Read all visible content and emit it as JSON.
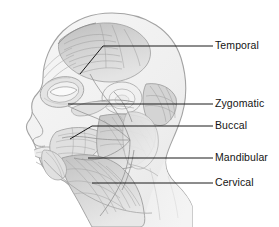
{
  "figure": {
    "background_color": "#ffffff",
    "outline_color": "#9a9a9a",
    "muscle_fill_light": "#e2e2e2",
    "muscle_fill_mid": "#c6c6c6",
    "muscle_fill_dark": "#a8a8a8",
    "skin_fill": "#f2f2f2",
    "leader_color": "#1a1a1a",
    "label_color": "#141414"
  },
  "labels": [
    {
      "id": "temporal",
      "text": "Temporal",
      "text_x": 215,
      "text_y": 40,
      "leader": "M 213 46 L 103 46 L 80 74",
      "anchor_x": 80,
      "anchor_y": 74
    },
    {
      "id": "zygomatic",
      "text": "Zygomatic",
      "text_x": 215,
      "text_y": 98,
      "leader": "M 213 104 L 68 104",
      "anchor_x": 68,
      "anchor_y": 104
    },
    {
      "id": "buccal",
      "text": "Buccal",
      "text_x": 215,
      "text_y": 120,
      "leader": "M 213 126 L 92 126 L 70 139",
      "anchor_x": 70,
      "anchor_y": 139
    },
    {
      "id": "mandibular",
      "text": "Mandibular",
      "text_x": 215,
      "text_y": 152,
      "leader": "M 213 158 L 88 158",
      "anchor_x": 88,
      "anchor_y": 158
    },
    {
      "id": "cervical",
      "text": "Cervical",
      "text_x": 215,
      "text_y": 177,
      "leader": "M 213 183 L 92 183",
      "anchor_x": 92,
      "anchor_y": 183
    }
  ],
  "anatomy": {
    "regions": [
      "temporalis",
      "orbicularis-oculi",
      "zygomaticus",
      "parotid-gland",
      "masseter",
      "buccinator",
      "orbicularis-oris",
      "depressor-anguli-oris",
      "platysma",
      "sternocleidomastoid"
    ],
    "nerve_trunk_label": "facial-nerve-trunk"
  }
}
